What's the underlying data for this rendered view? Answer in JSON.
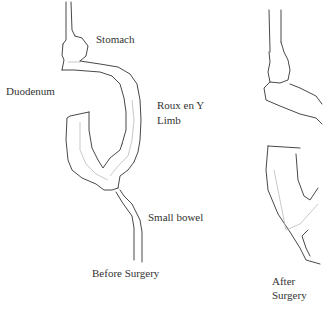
{
  "diagram": {
    "before": {
      "caption": "Before Surgery",
      "labels": {
        "stomach": "Stomach",
        "duodenum": "Duodenum",
        "roux_line1": "Roux en Y",
        "roux_line2": "Limb",
        "small_bowel": "Small bowel"
      }
    },
    "after": {
      "caption_line1": "After",
      "caption_line2": "Surgery"
    },
    "colors": {
      "outline": "#333333",
      "inner_line": "#bbbbbb",
      "text": "#333333",
      "background": "#ffffff"
    }
  }
}
